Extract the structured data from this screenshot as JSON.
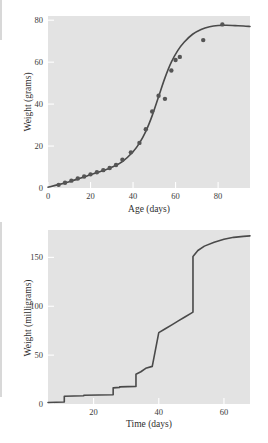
{
  "page": {
    "background_color": "#ffffff",
    "plot_background_color": "#e3e3e3",
    "line_color": "#4a4a4a",
    "marker_color": "#555555",
    "tick_color": "#3b3b3b",
    "figure_count": 2
  },
  "chart_data": [
    {
      "id": "growth-sigmoid",
      "type": "scatter",
      "title": "",
      "xlabel": "Age (days)",
      "ylabel": "Weight (grams)",
      "xlim": [
        0,
        95
      ],
      "ylim": [
        0,
        82
      ],
      "xticks": [
        0,
        20,
        40,
        60,
        80
      ],
      "xtick_labels": [
        "0",
        "20",
        "40",
        "60",
        "80"
      ],
      "yticks": [
        0,
        20,
        40,
        60,
        80
      ],
      "ytick_labels": [
        "0",
        "20",
        "40",
        "60",
        "80"
      ],
      "grid": false,
      "legend": "none",
      "series": [
        {
          "name": "observed weight",
          "kind": "points",
          "marker": "filled-circle",
          "x": [
            5,
            8,
            11,
            14,
            17,
            20,
            23,
            26,
            29,
            32,
            35,
            39,
            43,
            46,
            49,
            52,
            55,
            58,
            60,
            62,
            73,
            82
          ],
          "y": [
            1.5,
            2.5,
            3.5,
            4.5,
            5.5,
            6.5,
            7.5,
            8.5,
            9.5,
            11.0,
            13.5,
            17.0,
            21.5,
            28.0,
            36.5,
            44.0,
            42.5,
            56.0,
            61.0,
            62.5,
            70.5,
            78.0
          ]
        },
        {
          "name": "fitted logistic curve",
          "kind": "line",
          "x": [
            0,
            5,
            10,
            15,
            20,
            25,
            30,
            35,
            40,
            43,
            46,
            49,
            52,
            55,
            58,
            61,
            64,
            68,
            72,
            76,
            80,
            84,
            88,
            92,
            95
          ],
          "y": [
            0.4,
            1.6,
            3.0,
            4.6,
            6.3,
            8.0,
            9.9,
            12.6,
            17.3,
            21.4,
            27.0,
            34.5,
            43.5,
            52.5,
            60.0,
            65.5,
            69.5,
            73.3,
            75.6,
            76.9,
            77.5,
            77.6,
            77.4,
            77.2,
            77.0
          ]
        }
      ]
    },
    {
      "id": "molt-staircase",
      "type": "line",
      "title": "",
      "xlabel": "Time (days)",
      "ylabel": "Weight (milligrams)",
      "xlim": [
        6,
        68
      ],
      "ylim": [
        0,
        178
      ],
      "xticks": [
        20,
        40,
        60
      ],
      "xtick_labels": [
        "20",
        "40",
        "60"
      ],
      "yticks": [
        0,
        50,
        100,
        150
      ],
      "ytick_labels": [
        "0",
        "50",
        "100",
        "150"
      ],
      "grid": false,
      "legend": "none",
      "series": [
        {
          "name": "cumulative weight with molts",
          "kind": "step-line",
          "x": [
            6,
            11,
            11,
            17,
            17,
            26,
            26,
            28,
            28,
            33,
            33,
            34.5,
            36,
            38,
            40,
            42,
            44,
            46,
            48,
            50,
            50.5,
            50.5,
            52,
            54,
            57,
            60,
            63,
            66,
            68
          ],
          "y": [
            1.5,
            2.0,
            8.0,
            8.5,
            9.0,
            9.5,
            16.5,
            17.0,
            17.5,
            18.0,
            30.5,
            33.0,
            36.5,
            38.5,
            73.0,
            77.0,
            81.0,
            85.0,
            89.0,
            93.0,
            94.0,
            151.0,
            157.0,
            161.5,
            165.5,
            168.5,
            170.5,
            171.5,
            172.0
          ]
        }
      ]
    }
  ]
}
